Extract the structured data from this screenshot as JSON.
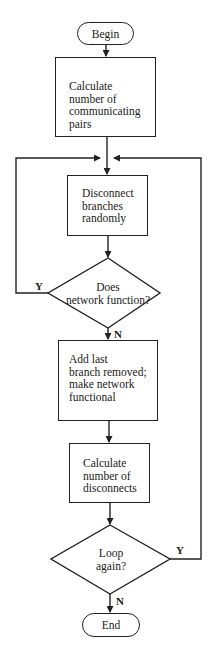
{
  "flowchart": {
    "nodes": {
      "begin": {
        "type": "terminal",
        "label": "Begin"
      },
      "calc_pairs": {
        "type": "process",
        "label": "Calculate\nnumber of\ncommunicating\npairs"
      },
      "disconnect": {
        "type": "process",
        "label": "Disconnect\nbranches\nrandomly"
      },
      "does_function": {
        "type": "decision",
        "label": "Does\nnetwork function?"
      },
      "add_last": {
        "type": "process",
        "label": "Add last\nbranch removed;\nmake network\nfunctional"
      },
      "calc_disconnects": {
        "type": "process",
        "label": "Calculate\nnumber of\ndisconnects"
      },
      "loop_again": {
        "type": "decision",
        "label": "Loop\nagain?"
      },
      "end": {
        "type": "terminal",
        "label": "End"
      }
    },
    "edges": [
      {
        "from": "begin",
        "to": "calc_pairs",
        "label": ""
      },
      {
        "from": "calc_pairs",
        "to": "disconnect",
        "label": ""
      },
      {
        "from": "disconnect",
        "to": "does_function",
        "label": ""
      },
      {
        "from": "does_function",
        "to": "disconnect",
        "label": "Y"
      },
      {
        "from": "does_function",
        "to": "add_last",
        "label": "N"
      },
      {
        "from": "add_last",
        "to": "calc_disconnects",
        "label": ""
      },
      {
        "from": "calc_disconnects",
        "to": "loop_again",
        "label": ""
      },
      {
        "from": "loop_again",
        "to": "disconnect",
        "label": "Y"
      },
      {
        "from": "loop_again",
        "to": "end",
        "label": "N"
      }
    ],
    "branch_labels": {
      "yes": "Y",
      "no": "N"
    }
  }
}
